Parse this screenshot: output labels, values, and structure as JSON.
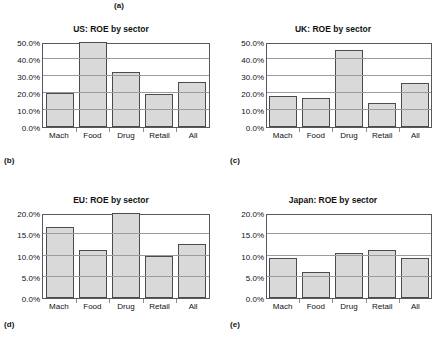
{
  "figure": {
    "captions": {
      "a": "(a)",
      "b": "(b)",
      "c": "(c)",
      "d": "(d)",
      "e": "(e)"
    }
  },
  "chart_data": [
    {
      "id": "us",
      "type": "bar",
      "title": "US: ROE by sector",
      "xlabel": "",
      "ylabel": "",
      "categories": [
        "Mach",
        "Food",
        "Drug",
        "Retail",
        "All"
      ],
      "values": [
        20.0,
        50.0,
        32.5,
        19.5,
        26.5
      ],
      "ylim": [
        0,
        50
      ],
      "yticks": [
        0,
        10,
        20,
        30,
        40,
        50
      ],
      "ytick_labels": [
        "0.0%",
        "10.0%",
        "20.0%",
        "30.0%",
        "40.0%",
        "50.0%"
      ],
      "grid": true,
      "legend": "none",
      "bar_fill": "#d9d9d9",
      "bar_border": "#4a4b4d"
    },
    {
      "id": "uk",
      "type": "bar",
      "title": "UK: ROE by sector",
      "xlabel": "",
      "ylabel": "",
      "categories": [
        "Mach",
        "Food",
        "Drug",
        "Retail",
        "All"
      ],
      "values": [
        18.2,
        17.0,
        45.5,
        14.2,
        25.8
      ],
      "ylim": [
        0,
        50
      ],
      "yticks": [
        0,
        10,
        20,
        30,
        40,
        50
      ],
      "ytick_labels": [
        "0.0%",
        "10.0%",
        "20.0%",
        "30.0%",
        "40.0%",
        "50.0%"
      ],
      "grid": true,
      "legend": "none",
      "bar_fill": "#d9d9d9",
      "bar_border": "#4a4b4d"
    },
    {
      "id": "eu",
      "type": "bar",
      "title": "EU: ROE by sector",
      "xlabel": "",
      "ylabel": "",
      "categories": [
        "Mach",
        "Food",
        "Drug",
        "Retail",
        "All"
      ],
      "values": [
        16.7,
        11.2,
        20.0,
        10.0,
        12.6
      ],
      "ylim": [
        0,
        20
      ],
      "yticks": [
        0,
        5,
        10,
        15,
        20
      ],
      "ytick_labels": [
        "0.0%",
        "5.0%",
        "10.0%",
        "15.0%",
        "20.0%"
      ],
      "grid": true,
      "legend": "none",
      "bar_fill": "#d9d9d9",
      "bar_border": "#4a4b4d"
    },
    {
      "id": "jp",
      "type": "bar",
      "title": "Japan: ROE by sector",
      "xlabel": "",
      "ylabel": "",
      "categories": [
        "Mach",
        "Food",
        "Drug",
        "Retail",
        "All"
      ],
      "values": [
        9.4,
        6.1,
        10.5,
        11.2,
        9.4
      ],
      "ylim": [
        0,
        20
      ],
      "yticks": [
        0,
        5,
        10,
        15,
        20
      ],
      "ytick_labels": [
        "0.0%",
        "5.0%",
        "10.0%",
        "15.0%",
        "20.0%"
      ],
      "grid": true,
      "legend": "none",
      "bar_fill": "#d9d9d9",
      "bar_border": "#4a4b4d"
    }
  ]
}
